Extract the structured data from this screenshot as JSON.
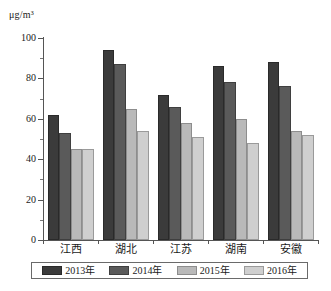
{
  "chart_data": {
    "type": "bar",
    "title": "",
    "subtitle": "",
    "xlabel": "",
    "ylabel": "μg/m³",
    "unit_label": "μg/m³",
    "ylim": [
      0,
      100
    ],
    "ytick_labels": [
      "0",
      "20",
      "40",
      "60",
      "80",
      "100"
    ],
    "ytick_values": [
      0,
      20,
      40,
      60,
      80,
      100
    ],
    "yminor_values": [
      10,
      30,
      50,
      70,
      90
    ],
    "grid": false,
    "legend_position": "bottom",
    "categories": [
      "江西",
      "湖北",
      "江苏",
      "湖南",
      "安徽"
    ],
    "series": [
      {
        "name": "2013年",
        "color": "#3b3b3b",
        "values": [
          62,
          94,
          72,
          86,
          88
        ]
      },
      {
        "name": "2014年",
        "color": "#5a5a5a",
        "values": [
          53,
          87,
          66,
          78,
          76
        ]
      },
      {
        "name": "2015年",
        "color": "#b9b9b9",
        "values": [
          45,
          65,
          58,
          60,
          54
        ]
      },
      {
        "name": "2016年",
        "color": "#cfcfcf",
        "values": [
          45,
          54,
          51,
          48,
          52
        ]
      }
    ]
  }
}
